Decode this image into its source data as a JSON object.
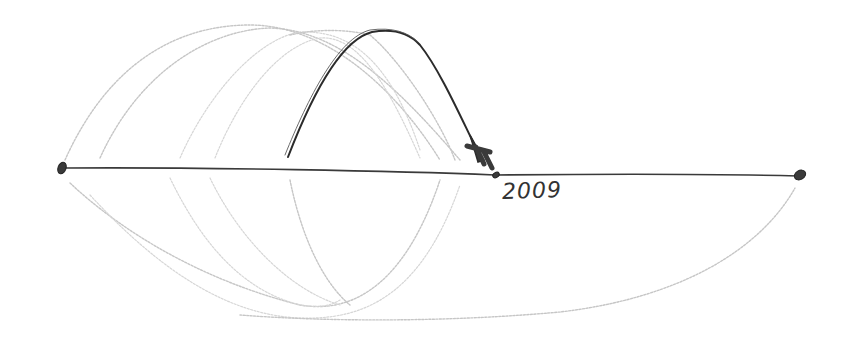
{
  "diagram": {
    "type": "hand-drawn timeline sketch",
    "timeline": {
      "start_point": [
        62,
        168
      ],
      "end_point": [
        800,
        175
      ],
      "marker": {
        "position": [
          495,
          175
        ],
        "label": "2009"
      }
    },
    "highlighted_arc": {
      "from": [
        288,
        157
      ],
      "peak": [
        375,
        30
      ],
      "to_arrowhead": [
        482,
        160
      ],
      "style": "dark pencil with arrowhead"
    },
    "faint_arcs_above_count": 5,
    "faint_arcs_below_count": 6,
    "colors": {
      "background": "#ffffff",
      "pencil_dark": "#2b2b2b",
      "pencil_faint": "#c6c6c6"
    }
  }
}
